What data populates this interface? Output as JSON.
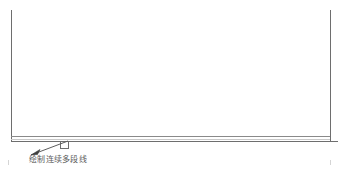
{
  "drawing": {
    "title": "CAD polyline drawing",
    "background_color": "#ffffff",
    "line_color": "#6e6e6e",
    "accent_line_color": "#8a8a8a",
    "text_color": "#5c5c5c",
    "annotation": {
      "label": "绘制连续多段线",
      "leader_from": "30,155",
      "leader_to": "69,141"
    },
    "elements": [
      {
        "name": "left-vertical-line",
        "x1": 11,
        "y1": 10,
        "x2": 11,
        "y2": 140
      },
      {
        "name": "right-vertical-line",
        "x1": 330,
        "y1": 10,
        "x2": 330,
        "y2": 140
      },
      {
        "name": "upper-horizontal-line",
        "x1": 11,
        "y1": 136,
        "x2": 330,
        "y2": 136
      },
      {
        "name": "lower-horizontal-line",
        "x1": 11,
        "y1": 141,
        "x2": 338,
        "y2": 141
      },
      {
        "name": "notch-rectangle",
        "x": 60,
        "y": 141,
        "width": 9,
        "height": 8
      }
    ],
    "bottom_ticks": [
      {
        "name": "bottom-tick-left",
        "x": 8,
        "y1": 160,
        "y2": 165
      },
      {
        "name": "bottom-tick-right",
        "x": 330,
        "y1": 160,
        "y2": 165
      }
    ]
  }
}
